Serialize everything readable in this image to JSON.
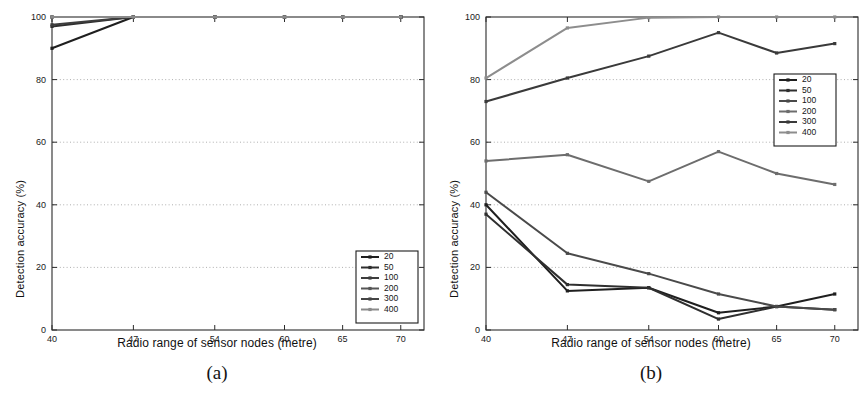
{
  "figure": {
    "panels": [
      {
        "caption": "(a)",
        "name": "panel-a"
      },
      {
        "caption": "(b)",
        "name": "panel-b"
      }
    ]
  },
  "chart_data": [
    {
      "type": "line",
      "panel": "(a)",
      "title": "",
      "xlabel": "Radio range of sensor nodes (metre)",
      "ylabel": "Detection accuracy (%)",
      "x": [
        40,
        47,
        54,
        60,
        65,
        70
      ],
      "xticklabels": [
        "40",
        "47",
        "54",
        "60",
        "65",
        "70"
      ],
      "yticklabels": [
        "0",
        "20",
        "40",
        "60",
        "80",
        "100"
      ],
      "yticks": [
        0,
        20,
        40,
        60,
        80,
        100
      ],
      "xlim": [
        40,
        72
      ],
      "ylim": [
        0,
        100
      ],
      "grid": "horizontal-dotted",
      "legend_position": "lower-right",
      "series": [
        {
          "name": "20",
          "color": "#1f1f1f",
          "values": [
            90,
            100,
            100,
            100,
            100,
            100
          ]
        },
        {
          "name": "50",
          "color": "#2e2e2e",
          "values": [
            97,
            100,
            100,
            100,
            100,
            100
          ]
        },
        {
          "name": "100",
          "color": "#3d3d3d",
          "values": [
            97.5,
            100,
            100,
            100,
            100,
            100
          ]
        },
        {
          "name": "200",
          "color": "#555555",
          "values": [
            100,
            100,
            100,
            100,
            100,
            100
          ]
        },
        {
          "name": "300",
          "color": "#444444",
          "values": [
            100,
            100,
            100,
            100,
            100,
            100
          ]
        },
        {
          "name": "400",
          "color": "#8a8a8a",
          "values": [
            100,
            100,
            100,
            100,
            100,
            100
          ]
        }
      ]
    },
    {
      "type": "line",
      "panel": "(b)",
      "title": "",
      "xlabel": "Radio range of sensor nodes (metre)",
      "ylabel": "Detection accuracy (%)",
      "x": [
        40,
        47,
        54,
        60,
        65,
        70
      ],
      "xticklabels": [
        "40",
        "47",
        "54",
        "60",
        "65",
        "70"
      ],
      "yticklabels": [
        "0",
        "20",
        "40",
        "60",
        "80",
        "100"
      ],
      "yticks": [
        0,
        20,
        40,
        60,
        80,
        100
      ],
      "xlim": [
        40,
        72
      ],
      "ylim": [
        0,
        100
      ],
      "grid": "horizontal-dotted",
      "legend_position": "upper-right",
      "series": [
        {
          "name": "20",
          "color": "#1f1f1f",
          "values": [
            40,
            12.5,
            13.5,
            5.5,
            7.5,
            11.5
          ]
        },
        {
          "name": "50",
          "color": "#2f2f2f",
          "values": [
            37,
            14.5,
            13.5,
            3.5,
            7.5,
            6.5
          ]
        },
        {
          "name": "100",
          "color": "#4a4a4a",
          "values": [
            44,
            24.5,
            18,
            11.5,
            7.5,
            6.5
          ]
        },
        {
          "name": "200",
          "color": "#6d6d6d",
          "values": [
            54,
            56,
            47.5,
            57,
            50,
            46.5
          ]
        },
        {
          "name": "300",
          "color": "#3a3a3a",
          "values": [
            73,
            80.5,
            87.5,
            95,
            88.5,
            91.5
          ]
        },
        {
          "name": "400",
          "color": "#8d8d8d",
          "values": [
            80.5,
            96.5,
            99.8,
            100,
            100,
            100
          ]
        }
      ]
    }
  ]
}
